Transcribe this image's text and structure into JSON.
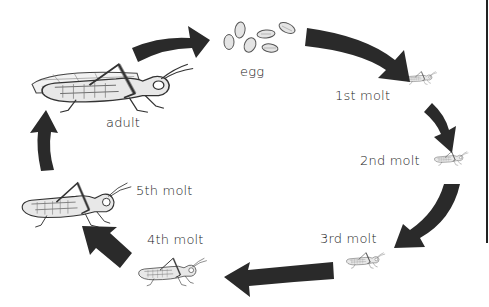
{
  "diagram": {
    "type": "cycle",
    "colors": {
      "arrow": "#2a2a2a",
      "insect_stroke": "#333333",
      "insect_fill": "#e6e6e6",
      "text": "#222222"
    },
    "stages": [
      {
        "id": "egg",
        "label": "egg"
      },
      {
        "id": "molt1",
        "label": "1st molt"
      },
      {
        "id": "molt2",
        "label": "2nd molt"
      },
      {
        "id": "molt3",
        "label": "3rd molt"
      },
      {
        "id": "molt4",
        "label": "4th molt"
      },
      {
        "id": "molt5",
        "label": "5th molt"
      },
      {
        "id": "adult",
        "label": "adult"
      }
    ],
    "arrows": [
      {
        "from": "adult",
        "to": "egg"
      },
      {
        "from": "egg",
        "to": "molt1"
      },
      {
        "from": "molt1",
        "to": "molt2"
      },
      {
        "from": "molt2",
        "to": "molt3"
      },
      {
        "from": "molt3",
        "to": "molt4"
      },
      {
        "from": "molt4",
        "to": "molt5"
      },
      {
        "from": "molt5",
        "to": "adult"
      }
    ]
  }
}
